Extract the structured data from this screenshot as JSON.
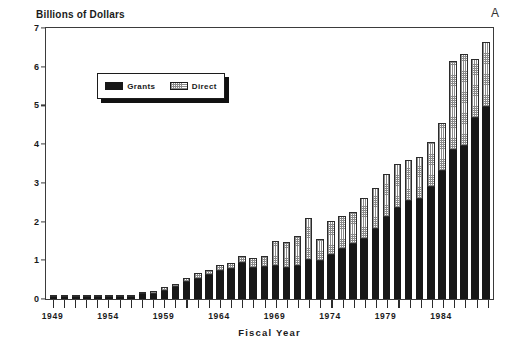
{
  "chart_data": {
    "type": "bar",
    "subtype": "stacked-vertical-bar",
    "title": "",
    "ylabel": "Billions of Dollars",
    "xlabel": "Fiscal Year",
    "ylim": [
      0,
      7
    ],
    "yticks": [
      0,
      1,
      2,
      3,
      4,
      5,
      6,
      7
    ],
    "ytick_labels": [
      "0",
      "1",
      "2",
      "3",
      "4",
      "5",
      "6",
      "7"
    ],
    "xtick_labels": [
      "1949",
      "1954",
      "1959",
      "1964",
      "1969",
      "1974",
      "1979",
      "1984"
    ],
    "xtick_label_indices": [
      0,
      5,
      10,
      15,
      20,
      25,
      30,
      35
    ],
    "grid": false,
    "legend_position": "upper-left-inside",
    "annotation": "A",
    "categories": [
      "1949",
      "1950",
      "1951",
      "1952",
      "1953",
      "1954",
      "1955",
      "1956",
      "1957",
      "1958",
      "1959",
      "1960",
      "1961",
      "1962",
      "1963",
      "1964",
      "1965",
      "1966",
      "1967",
      "1968",
      "1969",
      "1970",
      "1971",
      "1972",
      "1973",
      "1974",
      "1975",
      "1976",
      "1977",
      "1978",
      "1979",
      "1980",
      "1981",
      "1982",
      "1983",
      "1984",
      "1985",
      "1986",
      "1987",
      "1988"
    ],
    "series": [
      {
        "name": "Grants",
        "color": "#171717",
        "values": [
          0.01,
          0.01,
          0.01,
          0.01,
          0.02,
          0.02,
          0.03,
          0.04,
          0.12,
          0.14,
          0.2,
          0.31,
          0.45,
          0.52,
          0.62,
          0.72,
          0.78,
          0.92,
          0.8,
          0.82,
          0.84,
          0.8,
          0.86,
          1.0,
          0.98,
          1.14,
          1.3,
          1.42,
          1.56,
          1.8,
          2.12,
          2.36,
          2.54,
          2.58,
          2.9,
          3.3,
          3.84,
          3.94,
          4.68,
          4.96
        ]
      },
      {
        "name": "Direct",
        "color": "#ffffff",
        "pattern": "dotted-fill",
        "values": [
          0.01,
          0.01,
          0.01,
          0.01,
          0.02,
          0.02,
          0.03,
          0.04,
          0.06,
          0.07,
          0.1,
          0.09,
          0.1,
          0.14,
          0.12,
          0.16,
          0.14,
          0.18,
          0.26,
          0.28,
          0.66,
          0.66,
          0.76,
          1.1,
          0.56,
          0.88,
          0.84,
          0.84,
          1.04,
          1.06,
          1.1,
          1.12,
          1.06,
          1.08,
          1.16,
          1.24,
          2.3,
          2.38,
          1.52,
          1.68
        ]
      }
    ],
    "totals": [
      0.02,
      0.02,
      0.02,
      0.02,
      0.04,
      0.04,
      0.06,
      0.08,
      0.18,
      0.21,
      0.3,
      0.4,
      0.55,
      0.66,
      0.74,
      0.88,
      0.92,
      1.1,
      1.06,
      1.1,
      1.5,
      1.46,
      1.62,
      2.1,
      1.54,
      2.02,
      2.14,
      2.26,
      2.6,
      2.86,
      3.22,
      3.48,
      3.6,
      3.66,
      4.06,
      4.54,
      6.14,
      6.32,
      6.2,
      6.64
    ]
  },
  "legend": {
    "items": [
      {
        "label": "Grants",
        "swatch": "solid-black"
      },
      {
        "label": "Direct",
        "swatch": "dotted-white"
      }
    ]
  },
  "axes": {
    "y_title": "Billions of Dollars",
    "x_title": "Fiscal Year"
  },
  "annotations": {
    "panel_letter": "A"
  }
}
